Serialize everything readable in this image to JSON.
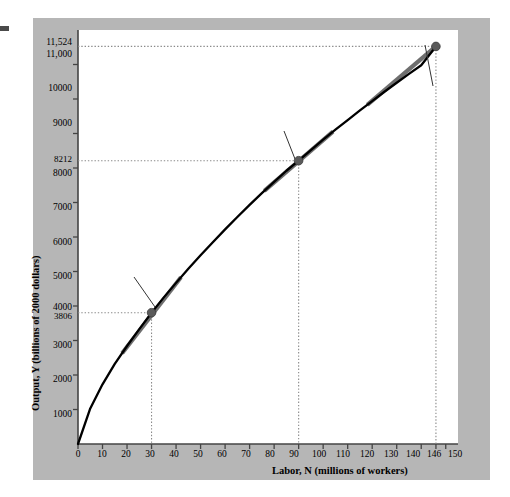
{
  "figure": {
    "background_color": "#b6b6b6",
    "plot_background": "#ffffff",
    "curve_color": "#000000",
    "tangent_color": "#6e6e6e",
    "marker_color": "#5a5a5a"
  },
  "axes": {
    "y_title": "Output, Y (billions of 2000 dollars)",
    "x_title": "Labor, N (millions of workers)",
    "y_ticks": [
      "1000",
      "2000",
      "3000",
      "4000",
      "5000",
      "6000",
      "7000",
      "8000",
      "9000",
      "10000",
      "11,000"
    ],
    "y_special_ticks": [
      "11,524",
      "8212",
      "3806"
    ],
    "x_ticks": [
      "0",
      "10",
      "20",
      "30",
      "40",
      "50",
      "60",
      "70",
      "80",
      "90",
      "100",
      "110",
      "120",
      "130",
      "140",
      "146",
      "150"
    ]
  },
  "annotations": {
    "production_function": "Production\nfunction",
    "production_function_line1": "Production",
    "production_function_line2": "function",
    "actual_line1": "Actual",
    "actual_line2": "2007",
    "slope_b_line1": "Slope = MPN",
    "slope_b_line2": "at point B",
    "slope_c_line1": "Slope = MPN",
    "slope_c_line2": "at point C",
    "slope_prefix": "Slope = ",
    "mpn": "MPN",
    "at_point": "at point ",
    "point_a": "A",
    "point_b": "B",
    "point_c": "C"
  },
  "chart_data": {
    "type": "line",
    "title": "",
    "xlabel": "Labor, N (millions of workers)",
    "ylabel": "Output, Y (billions of 2000 dollars)",
    "xlim": [
      0,
      155
    ],
    "ylim": [
      0,
      12000
    ],
    "grid": false,
    "legend": "none",
    "series": [
      {
        "name": "Production function",
        "x": [
          0,
          5,
          10,
          15,
          20,
          25,
          30,
          35,
          40,
          45,
          50,
          55,
          60,
          65,
          70,
          75,
          80,
          85,
          90,
          95,
          100,
          105,
          110,
          115,
          120,
          125,
          130,
          135,
          140,
          146
        ],
        "y": [
          0,
          1030,
          1730,
          2320,
          2840,
          3330,
          3806,
          4250,
          4670,
          5080,
          5470,
          5850,
          6220,
          6580,
          6930,
          7270,
          7600,
          7920,
          8212,
          8520,
          8820,
          9110,
          9390,
          9670,
          9940,
          10210,
          10470,
          10730,
          10980,
          11524
        ]
      }
    ],
    "points": [
      {
        "label": "A",
        "x": 146,
        "y": 11524,
        "note": "Actual 2007"
      },
      {
        "label": "B",
        "x": 30,
        "y": 3806,
        "note": "Slope = MPN at point B"
      },
      {
        "label": "C",
        "x": 90,
        "y": 8212,
        "note": "Slope = MPN at point C"
      }
    ],
    "tangents": [
      {
        "at_point": "B",
        "x_from": 18,
        "x_to": 42
      },
      {
        "at_point": "C",
        "x_from": 76,
        "x_to": 104
      },
      {
        "at_point": "A",
        "x_from": 118,
        "x_to": 146
      }
    ],
    "dropline_x_values": [
      30,
      90,
      146
    ],
    "dashed_y_values": [
      3806,
      8212,
      11524
    ]
  }
}
